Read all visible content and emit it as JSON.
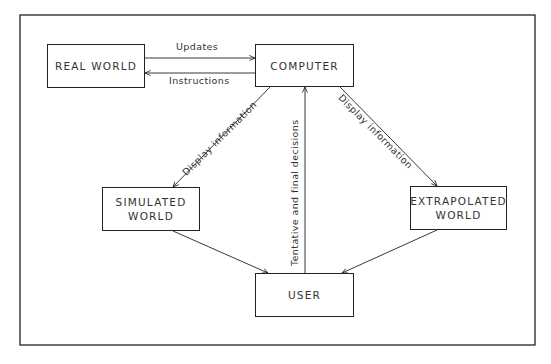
{
  "diagram": {
    "nodes": {
      "real_world": "REAL WORLD",
      "computer": "COMPUTER",
      "simulated_world": [
        "SIMULATED",
        "WORLD"
      ],
      "extrapolated_world": [
        "EXTRAPOLATED",
        "WORLD"
      ],
      "user": "USER"
    },
    "edges": {
      "updates": "Updates",
      "instructions": "Instructions",
      "display_left": "Display information",
      "display_right": "Display information",
      "decisions": "Tentative and final decisions"
    },
    "colors": {
      "line": "#222222",
      "background": "#ffffff"
    }
  }
}
